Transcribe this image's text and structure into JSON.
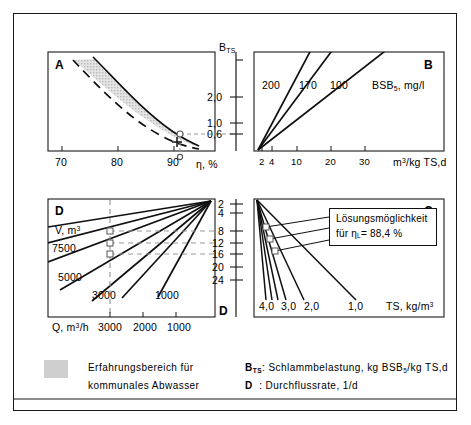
{
  "figure": {
    "type": "four-quadrant-nomogram",
    "title_hidden": "",
    "quadrants": [
      "A",
      "B",
      "C",
      "D"
    ]
  },
  "quadrantA": {
    "id": "A",
    "xlabel": "η, %",
    "xticks": [
      "70",
      "80",
      "90"
    ],
    "xlim": [
      68,
      94
    ],
    "shaded_region_note": "Erfahrungsbereich",
    "solution_marker_x": "88.4",
    "solution_marker_y": "0.6"
  },
  "quadrantB": {
    "id": "B",
    "ylabel": "B",
    "ylabel_sub": "TS",
    "yticks": [
      "2,0",
      "1,0",
      "0,6"
    ],
    "xlabel_main": "m",
    "xlabel_sup": "3",
    "xlabel_rest": "/kg TS,d",
    "xticks": [
      "2",
      "4",
      "10",
      "20",
      "30"
    ],
    "series_legend": "BSB",
    "series_legend_sub": "5",
    "series_legend_unit": ", mg/l",
    "curves": [
      "200",
      "170",
      "100"
    ]
  },
  "quadrantC": {
    "id": "C",
    "xlabel_main": "TS, kg/m",
    "xlabel_sup": "3",
    "curves": [
      "4,0",
      "3,0",
      "2,0",
      "1,0"
    ],
    "callout_line1": "Lösungsmöglichkeit",
    "callout_line2_pre": "für η",
    "callout_line2_sub": "L",
    "callout_line2_post": "= 88,4 %"
  },
  "quadrantD": {
    "id": "D",
    "axis_id": "D",
    "ylabel_ticks": [
      "2",
      "4",
      "8",
      "12",
      "16",
      "20",
      "24"
    ],
    "vlabel_main": "V, m",
    "vlabel_sup": "3",
    "curves": [
      "7500",
      "5000",
      "3000",
      "1000"
    ],
    "xlabel_main": "Q, m",
    "xlabel_sup": "3",
    "xlabel_rest": "/h",
    "xticks": [
      "3000",
      "2000",
      "1000"
    ]
  },
  "legend": {
    "swatch_color": "#cfcfcf",
    "shade_line1": "Erfahrungsbereich für",
    "shade_line2": "kommunales Abwasser",
    "def1_sym": "B",
    "def1_sub": "TS",
    "def1_colon": ":",
    "def1_text_pre": "Schlammbelastung, kg BSB",
    "def1_text_sub": "5",
    "def1_text_post": "/kg TS,d",
    "def2_sym": "D",
    "def2_colon": ":",
    "def2_text": "Durchflussrate, 1/d"
  },
  "colors": {
    "ink": "#1a1a1a",
    "shade": "#cfcfcf",
    "dash": "#8a8a8a"
  }
}
